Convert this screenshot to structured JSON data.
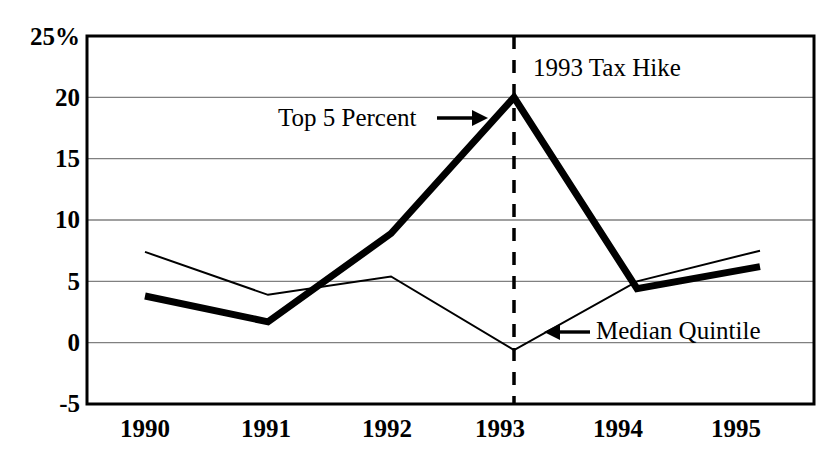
{
  "chart_data": {
    "type": "line",
    "title": "",
    "subtitle": "",
    "xlabel": "",
    "ylabel": "",
    "categories": [
      "1990",
      "1991",
      "1992",
      "1993",
      "1994",
      "1995"
    ],
    "x_tick_labels": [
      "1990",
      "1991",
      "1992",
      "1993",
      "1994",
      "1995"
    ],
    "y_tick_labels": [
      "25%",
      "20",
      "15",
      "10",
      "5",
      "0",
      "-5"
    ],
    "y_tick_values": [
      25,
      20,
      15,
      10,
      5,
      0,
      -5
    ],
    "ylim": [
      -5,
      25
    ],
    "grid": "horizontal",
    "legend_position": "inline-annotations",
    "series": [
      {
        "name": "Top 5 Percent",
        "style": "thick",
        "color": "#000000",
        "line_width": 7,
        "values": [
          3.8,
          1.7,
          8.9,
          20.0,
          4.4,
          6.2
        ]
      },
      {
        "name": "Median Quintile",
        "style": "thin",
        "color": "#000000",
        "line_width": 2,
        "values": [
          7.4,
          3.9,
          5.4,
          -0.6,
          5.0,
          7.5
        ]
      }
    ],
    "annotations": [
      {
        "id": "tax-hike",
        "text": "1993 Tax Hike",
        "x_value": 1993,
        "note": "label for dashed vertical marker line"
      },
      {
        "id": "top5",
        "text": "Top 5 Percent",
        "arrow": "→",
        "target_series": "Top 5 Percent"
      },
      {
        "id": "median",
        "text": "Median Quintile",
        "arrow": "←",
        "target_series": "Median Quintile"
      }
    ],
    "marker_lines": [
      {
        "id": "tax-hike-line",
        "orientation": "vertical",
        "x_value": 1993,
        "style": "dashed",
        "color": "#000000"
      }
    ]
  },
  "axis": {
    "y_ticks": [
      {
        "label": "25%",
        "value": 25
      },
      {
        "label": "20",
        "value": 20
      },
      {
        "label": "15",
        "value": 15
      },
      {
        "label": "10",
        "value": 10
      },
      {
        "label": "5",
        "value": 5
      },
      {
        "label": "0",
        "value": 0
      },
      {
        "label": "-5",
        "value": -5
      }
    ],
    "x_ticks": [
      {
        "label": "1990",
        "value": 1990
      },
      {
        "label": "1991",
        "value": 1991
      },
      {
        "label": "1992",
        "value": 1992
      },
      {
        "label": "1993",
        "value": 1993
      },
      {
        "label": "1994",
        "value": 1994
      },
      {
        "label": "1995",
        "value": 1995
      }
    ]
  },
  "annotations": {
    "tax_hike": "1993 Tax Hike",
    "top5_label": "Top 5 Percent",
    "top5_arrow": "→",
    "median_label": "Median Quintile",
    "median_arrow": "←"
  },
  "colors": {
    "plot_border": "#000000",
    "gridline": "#808080",
    "series_thick": "#000000",
    "series_thin": "#000000",
    "background": "#ffffff"
  }
}
